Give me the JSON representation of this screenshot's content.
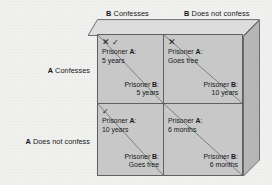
{
  "figure": {
    "colors": {
      "background": "#f1f1ef",
      "cell_fill": "#c8c8c8",
      "box_top_face": "#dcdcdc",
      "box_right_face": "#b4b4b4",
      "line": "#5d6163",
      "text": "#16181a"
    }
  },
  "column_headers": [
    {
      "bold": "B",
      "rest": " Confesses"
    },
    {
      "bold": "B",
      "rest": " Does not confess"
    }
  ],
  "row_headers": [
    {
      "bold": "A",
      "rest": " Confesses"
    },
    {
      "bold": "A",
      "rest": " Does not confess"
    }
  ],
  "marks": {
    "x": "✕",
    "check": "✓"
  },
  "cells": [
    {
      "id": "cell-0-0",
      "row": "A Confesses",
      "column": "B Confesses",
      "marks": [
        "x",
        "check"
      ],
      "prisoner_a": {
        "label_bold": "A",
        "label_prefix": "Prisoner ",
        "label_suffix": ":",
        "outcome": "5 years"
      },
      "prisoner_b": {
        "label_bold": "B",
        "label_prefix": "Prisoner ",
        "label_suffix": ":",
        "outcome": "5 years"
      }
    },
    {
      "id": "cell-0-1",
      "row": "A Confesses",
      "column": "B Does not confess",
      "marks": [
        "x"
      ],
      "prisoner_a": {
        "label_bold": "A",
        "label_prefix": "Prisoner ",
        "label_suffix": ":",
        "outcome": "Goes free"
      },
      "prisoner_b": {
        "label_bold": "B",
        "label_prefix": "Prisoner ",
        "label_suffix": ":",
        "outcome": "10 years"
      }
    },
    {
      "id": "cell-1-0",
      "row": "A Does not confess",
      "column": "B Confesses",
      "marks": [
        "check"
      ],
      "prisoner_a": {
        "label_bold": "A",
        "label_prefix": "Prisoner ",
        "label_suffix": ":",
        "outcome": "10 years"
      },
      "prisoner_b": {
        "label_bold": "B",
        "label_prefix": "Prisoner ",
        "label_suffix": ":",
        "outcome": "Goes free"
      }
    },
    {
      "id": "cell-1-1",
      "row": "A Does not confess",
      "column": "B Does not confess",
      "marks": [],
      "prisoner_a": {
        "label_bold": "A",
        "label_prefix": "Prisoner ",
        "label_suffix": ":",
        "outcome": "6 months"
      },
      "prisoner_b": {
        "label_bold": "B",
        "label_prefix": "Prisoner ",
        "label_suffix": ":",
        "outcome": "6 months"
      }
    }
  ]
}
